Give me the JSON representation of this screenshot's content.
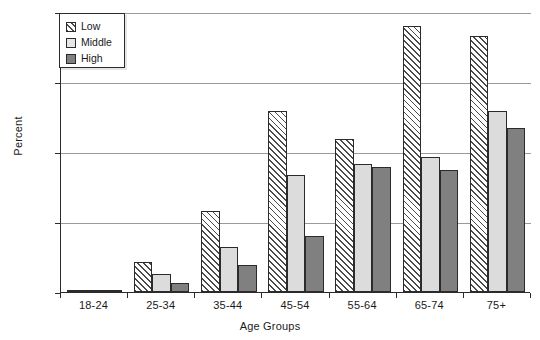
{
  "chart_data": {
    "type": "bar",
    "title": "",
    "xlabel": "Age Groups",
    "ylabel": "Percent",
    "categories": [
      "18-24",
      "25-34",
      "35-44",
      "45-54",
      "55-64",
      "65-74",
      "75+"
    ],
    "series": [
      {
        "name": "Low",
        "values": [
          0.3,
          4.3,
          11.6,
          25.9,
          21.8,
          38.0,
          36.6
        ],
        "pattern": "diagonal-hatch",
        "color": "#ffffff"
      },
      {
        "name": "Middle",
        "values": [
          0.3,
          2.6,
          6.4,
          16.7,
          18.3,
          19.3,
          25.9
        ],
        "pattern": "solid",
        "color": "#dcdcdc"
      },
      {
        "name": "High",
        "values": [
          0.2,
          1.3,
          3.9,
          8.0,
          17.8,
          17.4,
          23.4
        ],
        "pattern": "solid",
        "color": "#808080"
      }
    ],
    "ylim": [
      0,
      40
    ],
    "yticks": [
      0,
      10,
      20,
      30,
      40
    ],
    "ytick_labels": [
      "0",
      "10",
      "20",
      "30",
      "40"
    ],
    "grid": "horizontal",
    "legend_position": "top-left",
    "legend_entries": [
      "Low",
      "Middle",
      "High"
    ]
  },
  "axes": {
    "y_title": "Percent",
    "x_title": "Age Groups"
  }
}
